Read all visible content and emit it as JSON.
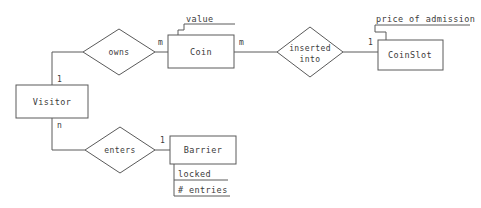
{
  "diagram": {
    "type": "entity-relationship-diagram",
    "title": "",
    "stroke_color": "#5a5a5a",
    "text_color": "#3b3b3b",
    "background_color": "#ffffff",
    "entities": [
      {
        "id": "visitor",
        "label": "Visitor",
        "x": 16,
        "y": 85,
        "w": 72,
        "h": 33
      },
      {
        "id": "coin",
        "label": "Coin",
        "x": 168,
        "y": 35,
        "w": 66,
        "h": 33
      },
      {
        "id": "coinslot",
        "label": "CoinSlot",
        "x": 378,
        "y": 40,
        "w": 65,
        "h": 30
      },
      {
        "id": "barrier",
        "label": "Barrier",
        "x": 170,
        "y": 136,
        "w": 66,
        "h": 28
      }
    ],
    "relationships": [
      {
        "id": "owns",
        "label": "owns",
        "cx": 119,
        "cy": 52,
        "rx": 36,
        "ry": 23
      },
      {
        "id": "inserted-into",
        "label_line1": "inserted",
        "label_line2": "into",
        "cx": 310,
        "cy": 52,
        "rx": 33,
        "ry": 25
      },
      {
        "id": "enters",
        "label": "enters",
        "cx": 120,
        "cy": 150,
        "rx": 35,
        "ry": 23
      }
    ],
    "attributes": [
      {
        "id": "value",
        "label": "value",
        "owner": "coin",
        "x": 186,
        "y": 18
      },
      {
        "id": "price-of-admission",
        "label": "price of admission",
        "owner": "coinslot",
        "x": 376,
        "y": 18
      },
      {
        "id": "locked",
        "label": "locked",
        "owner": "barrier",
        "x": 176,
        "y": 175
      },
      {
        "id": "entries",
        "label": "# entries",
        "owner": "barrier",
        "x": 176,
        "y": 191
      }
    ],
    "cardinalities": [
      {
        "id": "visitor-owns",
        "label": "1",
        "x": 57,
        "y": 82
      },
      {
        "id": "owns-coin",
        "label": "m",
        "x": 159,
        "y": 45
      },
      {
        "id": "coin-inserted",
        "label": "m",
        "x": 240,
        "y": 45
      },
      {
        "id": "inserted-coinslot",
        "label": "1",
        "x": 369,
        "y": 45
      },
      {
        "id": "visitor-enters",
        "label": "n",
        "x": 57,
        "y": 128
      },
      {
        "id": "enters-barrier",
        "label": "1",
        "x": 161,
        "y": 143
      }
    ]
  }
}
